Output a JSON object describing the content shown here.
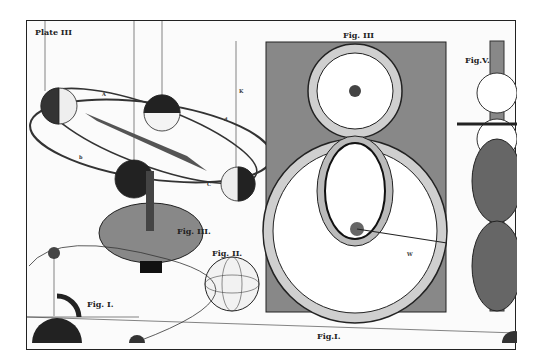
{
  "plate": {
    "title": "Plate III",
    "figures": {
      "fig1": "Fig. I.",
      "fig1_bottom": "Fig.I.",
      "fig2": "Fig. II.",
      "fig3": "Fig. III.",
      "fig4": "Fig. III",
      "fig5": "Fig.V."
    },
    "orbit_labels": [
      "A",
      "a",
      "B",
      "b",
      "C",
      "c",
      "D",
      "d",
      "K",
      "III",
      "IV"
    ],
    "fig1_labels": [
      "H",
      "A",
      "D",
      "E",
      "G",
      "K",
      "F",
      "B"
    ],
    "fig5_labels": [
      "A",
      "C",
      "N"
    ],
    "dial_words": [
      "Signs",
      "Signs",
      "Signs",
      "Signs",
      "Signs"
    ],
    "dial_roman": [
      "VIII",
      "V",
      "VI",
      "III",
      "II",
      "IV",
      "X",
      "XI"
    ],
    "pointer_label": "W"
  }
}
